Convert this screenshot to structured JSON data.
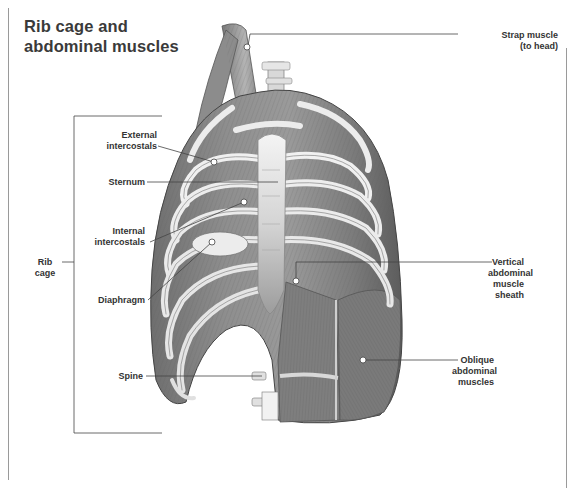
{
  "title": {
    "line1": "Rib cage and",
    "line2": "abdominal muscles"
  },
  "labels": {
    "strap_muscle": {
      "line1": "Strap muscle",
      "line2": "(to head)"
    },
    "external_intercostals": {
      "line1": "External",
      "line2": "intercostals"
    },
    "sternum": {
      "line1": "Sternum"
    },
    "internal_intercostals": {
      "line1": "Internal",
      "line2": "intercostals"
    },
    "rib_cage": {
      "line1": "Rib",
      "line2": "cage"
    },
    "diaphragm": {
      "line1": "Diaphragm"
    },
    "vertical_sheath": {
      "line1": "Vertical",
      "line2": "abdominal",
      "line3": "muscle",
      "line4": "sheath"
    },
    "oblique": {
      "line1": "Oblique",
      "line2": "abdominal",
      "line3": "muscles"
    },
    "spine": {
      "line1": "Spine"
    }
  },
  "colors": {
    "frame": "#9a9a9a",
    "leader": "#444444",
    "muscle_dark": "#5a5a5a",
    "muscle_mid": "#8a8a8a",
    "bone": "#e8e8e8"
  }
}
